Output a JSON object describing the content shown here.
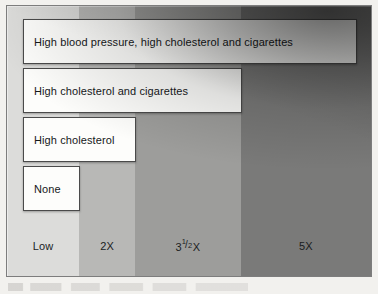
{
  "chart_data": {
    "type": "bar",
    "title": "",
    "subtitle": "",
    "xlabel": "",
    "ylabel": "",
    "orientation": "horizontal",
    "grid": false,
    "legend": false,
    "axis_tick_labels": [
      "Low",
      "2X",
      "3½ X",
      "5X"
    ],
    "axis_tick_values": [
      1,
      2,
      3.5,
      5
    ],
    "categories": [
      "High blood pressure, high cholesterol and cigarettes",
      "High cholesterol and cigarettes",
      "High cholesterol",
      "None"
    ],
    "values": [
      5,
      3.5,
      2,
      1
    ],
    "value_labels": [
      "5X",
      "3½ X",
      "2X",
      "Low"
    ],
    "band_colors": [
      "#dcdcda",
      "#b8b8b6",
      "#9d9d9b",
      "#7a7a79"
    ]
  },
  "figure": {
    "bands": [
      {
        "name": "low",
        "label": "Low",
        "width_pct": 19.8,
        "color": "#dcdcda"
      },
      {
        "name": "two-x",
        "label": "2X",
        "width_pct": 15.4,
        "color": "#b8b8b6"
      },
      {
        "name": "three-half",
        "label": "3",
        "num": "1",
        "slash": "/",
        "den": "2",
        "suffix": "X",
        "width_pct": 29.0,
        "color": "#9d9d9b"
      },
      {
        "name": "five-x",
        "label": "5X",
        "width_pct": 35.8,
        "color": "#7a7a79"
      }
    ],
    "bars": [
      {
        "name": "bar-bp-chol-cigarettes",
        "label": "High blood pressure, high cholesterol and cigarettes",
        "left_px": 16,
        "top_px": 13,
        "width_px": 334,
        "height_px": 45
      },
      {
        "name": "bar-chol-cigarettes",
        "label": "High cholesterol and cigarettes",
        "left_px": 16,
        "top_px": 62,
        "width_px": 219,
        "height_px": 45
      },
      {
        "name": "bar-high-cholesterol",
        "label": "High cholesterol",
        "left_px": 16,
        "top_px": 111,
        "width_px": 113,
        "height_px": 45
      },
      {
        "name": "bar-none",
        "label": "None",
        "left_px": 16,
        "top_px": 160,
        "width_px": 57,
        "height_px": 45
      }
    ]
  }
}
